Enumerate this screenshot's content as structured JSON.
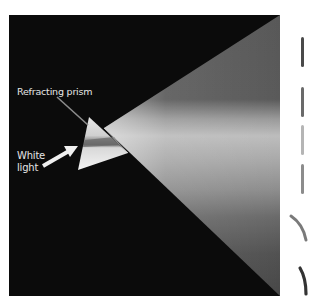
{
  "figure": {
    "labels": {
      "prism": "Refracting prism",
      "white_light_line1": "White",
      "white_light_line2": "light"
    },
    "colors": {
      "background": "#0b0b0b",
      "page": "#ffffff",
      "cone_top": "#555555",
      "cone_bright": "#bdbdbd",
      "cone_mid": "#8a8a8a",
      "cone_bottom": "#484848",
      "prism_light": "#f2f2f2",
      "prism_band": "#6a6a6a",
      "leader_line": "#8c8c8c",
      "arrow": "#f0f0f0",
      "label_text": "#e6e6e6"
    },
    "side_strips": [
      {
        "name": "strip-1",
        "shape": "straight",
        "shade": "#4a4a4a"
      },
      {
        "name": "strip-2",
        "shape": "straight",
        "shade": "#6a6a6a"
      },
      {
        "name": "strip-3",
        "shape": "straight",
        "shade": "#b5b5b5"
      },
      {
        "name": "strip-4",
        "shape": "straight",
        "shade": "#8c8c8c"
      },
      {
        "name": "strip-5",
        "shape": "curved",
        "shade": "#7a7a7a"
      },
      {
        "name": "strip-6",
        "shape": "curved",
        "shade": "#333333"
      }
    ]
  }
}
